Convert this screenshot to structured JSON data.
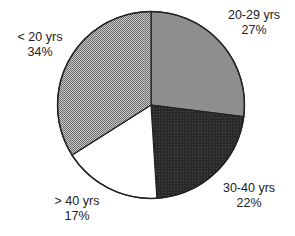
{
  "chart_data": {
    "type": "pie",
    "title": "",
    "start_angle": "12 o'clock",
    "direction": "clockwise",
    "legend": "none (direct labels)",
    "slices": [
      {
        "label": "20-29 yrs",
        "value": 27,
        "value_label": "27%",
        "fill": "#8f8f8f",
        "pattern": "solid-gray"
      },
      {
        "label": "30-40 yrs",
        "value": 22,
        "value_label": "22%",
        "fill": "#2b2b2b",
        "pattern": "dark-dotted"
      },
      {
        "label": "> 40 yrs",
        "value": 17,
        "value_label": "17%",
        "fill": "#ffffff",
        "pattern": "white"
      },
      {
        "label": "< 20 yrs",
        "value": 34,
        "value_label": "34%",
        "fill": "#a8a8a8",
        "pattern": "checkered"
      }
    ]
  },
  "labels": {
    "s0": {
      "name": "20-29 yrs",
      "pct": "27%"
    },
    "s1": {
      "name": "30-40 yrs",
      "pct": "22%"
    },
    "s2": {
      "name": "> 40 yrs",
      "pct": "17%"
    },
    "s3": {
      "name": "< 20 yrs",
      "pct": "34%"
    }
  }
}
